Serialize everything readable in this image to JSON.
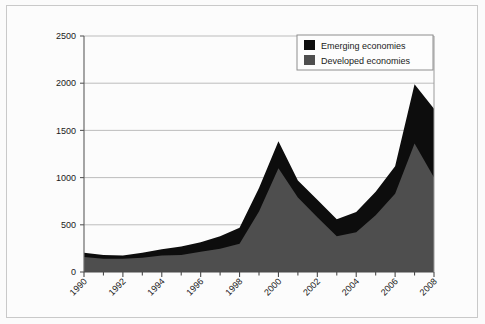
{
  "chart_data": {
    "type": "area",
    "stacked": true,
    "title": "",
    "xlabel": "",
    "ylabel": "",
    "xlim": [
      1990,
      2008
    ],
    "ylim": [
      0,
      2500
    ],
    "yticks": [
      0,
      500,
      1000,
      1500,
      2000,
      2500
    ],
    "ytick_labels": [
      "0",
      "500",
      "1000",
      "1500",
      "2000",
      "2500"
    ],
    "x": [
      1990,
      1991,
      1992,
      1993,
      1994,
      1995,
      1996,
      1997,
      1998,
      1999,
      2000,
      2001,
      2002,
      2003,
      2004,
      2005,
      2006,
      2007,
      2008
    ],
    "xtick_labels": [
      "1990",
      "1992",
      "1994",
      "1996",
      "1998",
      "2000",
      "2002",
      "2004",
      "2006",
      "2008"
    ],
    "xticks_labeled": [
      1990,
      1992,
      1994,
      1996,
      1998,
      2000,
      2002,
      2004,
      2006,
      2008
    ],
    "minor_ticks": [
      1991,
      1993,
      1995,
      1997,
      1999,
      2001,
      2003,
      2005,
      2007
    ],
    "grid": "horizontal",
    "legend_position": "top-right",
    "series": [
      {
        "name": "Developed economies",
        "color": "#4e4e4e",
        "values": [
          160,
          140,
          140,
          150,
          175,
          180,
          215,
          245,
          300,
          640,
          1100,
          790,
          580,
          380,
          420,
          600,
          830,
          1360,
          1000
        ]
      },
      {
        "name": "Emerging economies",
        "color": "#0d0d0d",
        "values": [
          45,
          40,
          35,
          55,
          65,
          90,
          100,
          135,
          170,
          250,
          285,
          180,
          185,
          180,
          215,
          250,
          290,
          630,
          730
        ]
      }
    ],
    "totals": [
      205,
      180,
      175,
      205,
      240,
      270,
      315,
      380,
      470,
      890,
      1385,
      970,
      765,
      560,
      635,
      850,
      1120,
      1990,
      1730
    ]
  },
  "legend": {
    "entries": [
      {
        "label": "Emerging economies",
        "swatch": "#0d0d0d"
      },
      {
        "label": "Developed economies",
        "swatch": "#4e4e4e"
      }
    ]
  },
  "axis": {
    "y_labels": [
      "2500",
      "2000",
      "1500",
      "1000",
      "500",
      "0"
    ],
    "x_labels": [
      "1990",
      "1992",
      "1994",
      "1996",
      "1998",
      "2000",
      "2002",
      "2004",
      "2006",
      "2008"
    ]
  },
  "colors": {
    "emerging": "#0d0d0d",
    "developed": "#4e4e4e",
    "grid": "#b6b6b6",
    "axis": "#5a5a5a",
    "background": "#fcfcfc",
    "border": "#c9c9c9"
  }
}
